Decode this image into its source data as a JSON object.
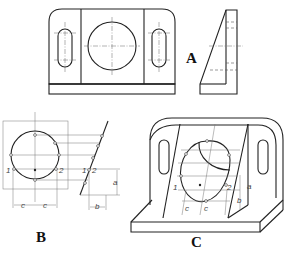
{
  "figure": {
    "views": [
      {
        "id": "A",
        "label": "A",
        "description": "Orthographic views: front view of bracket with central circular hole and two slotted holes; side view of inclined face"
      },
      {
        "id": "B",
        "label": "B",
        "description": "Construction of ellipse points on inclined face using offsets"
      },
      {
        "id": "C",
        "label": "C",
        "description": "Isometric pictorial of bracket with circle on inclined face drawn as ellipse"
      }
    ],
    "annotations": {
      "point_1": "1",
      "point_2": "2",
      "dim_a": "a",
      "dim_b": "b",
      "dim_c": "c"
    }
  }
}
